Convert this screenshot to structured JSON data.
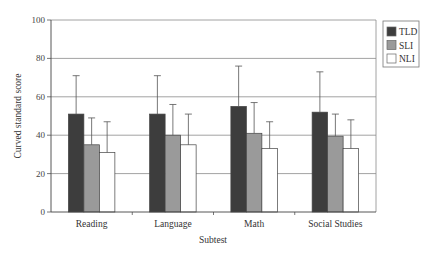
{
  "chart_data": {
    "type": "bar",
    "title": "",
    "xlabel": "Subtest",
    "ylabel": "Curved standard score",
    "ylim": [
      0,
      100
    ],
    "yticks": [
      0,
      20,
      40,
      60,
      80,
      100
    ],
    "grid": true,
    "legend_position": "right-top",
    "categories": [
      "Reading",
      "Language",
      "Math",
      "Social Studies"
    ],
    "series": [
      {
        "name": "TLD",
        "color": "#3d3d3d",
        "values": [
          51,
          51,
          55,
          52
        ],
        "error_upper": [
          71,
          71,
          76,
          73
        ]
      },
      {
        "name": "SLI",
        "color": "#9a9a9a",
        "values": [
          35,
          40,
          41,
          39.5
        ],
        "error_upper": [
          49,
          56,
          57,
          51
        ]
      },
      {
        "name": "NLI",
        "color": "#ffffff",
        "values": [
          31,
          35,
          33,
          33
        ],
        "error_upper": [
          47,
          51,
          47,
          48
        ]
      }
    ]
  },
  "legend": {
    "items": [
      {
        "label": "TLD",
        "color": "#3d3d3d"
      },
      {
        "label": "SLI",
        "color": "#9a9a9a"
      },
      {
        "label": "NLI",
        "color": "#ffffff"
      }
    ]
  }
}
